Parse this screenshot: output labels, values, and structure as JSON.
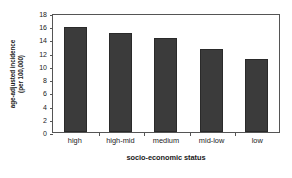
{
  "chart_data": {
    "type": "bar",
    "title": "",
    "categories": [
      "high",
      "high-mid",
      "medium",
      "mid-low",
      "low"
    ],
    "values": [
      15.9,
      15.0,
      14.2,
      12.5,
      11.0
    ],
    "xlabel": "socio-economic status",
    "ylabel_line1": "age-adjusted incidence",
    "ylabel_line2": "(per 100,000)",
    "ylim": [
      0,
      18
    ],
    "yticks": [
      0,
      2,
      4,
      6,
      8,
      10,
      12,
      14,
      16,
      18
    ],
    "ytick_labels": [
      "0",
      "2",
      "4",
      "6",
      "8",
      "10",
      "12",
      "14",
      "16",
      "18"
    ],
    "grid": false,
    "legend": false,
    "bar_color": "#3b3b3b",
    "bar_edge_color": "#2a2a2a",
    "axis_color": "#555555",
    "background_color": "#ffffff"
  }
}
